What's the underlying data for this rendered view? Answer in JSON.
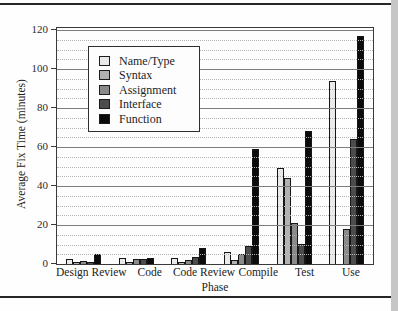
{
  "figure": {
    "background_hex": "#fefefe",
    "frame_hex": "#3a3a3a",
    "page_rule_hex": "#262626",
    "page_edge_hex": "#c6c6c6"
  },
  "chart_data": {
    "type": "bar",
    "title": "",
    "xlabel": "Phase",
    "ylabel": "Average Fix Time (minutes)",
    "ylim": [
      0,
      120
    ],
    "y_major_step": 20,
    "y_minor_step": 5,
    "y_tick_values": [
      0,
      20,
      40,
      60,
      80,
      100,
      120
    ],
    "grid": "horizontal: major solid, minor dotted",
    "legend_position": "upper-left inside plot",
    "categories": [
      "Design Review",
      "Code",
      "Code Review",
      "Compile",
      "Test",
      "Use"
    ],
    "series": [
      {
        "name": "Name/Type",
        "color": "#eaeaea",
        "values": [
          2.5,
          3,
          3,
          6,
          49,
          94
        ]
      },
      {
        "name": "Syntax",
        "color": "#b2b2b2",
        "values": [
          1,
          1,
          1,
          2,
          44,
          0
        ]
      },
      {
        "name": "Assignment",
        "color": "#8a8a8a",
        "values": [
          1.5,
          2.5,
          2,
          5,
          21,
          18
        ]
      },
      {
        "name": "Interface",
        "color": "#4c4c4c",
        "values": [
          1,
          2.5,
          3.5,
          9,
          10,
          64
        ]
      },
      {
        "name": "Function",
        "color": "#0b0b0b",
        "values": [
          5,
          3,
          8,
          59,
          68,
          117
        ]
      }
    ]
  }
}
